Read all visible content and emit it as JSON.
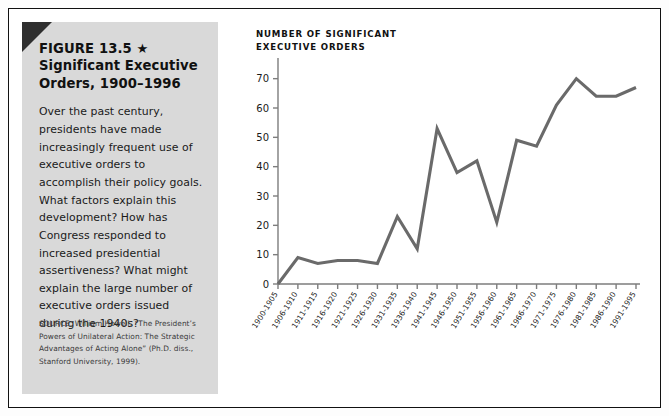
{
  "figure": {
    "title_line1": "FIGURE 13.5 ★",
    "title_line2": "Significant Executive",
    "title_line3": "Orders, 1900–1996",
    "body": "Over the past century, presidents have made increasingly frequent use of executive orders to accomplish their policy goals. What factors explain this development? How has Congress responded to increased presidential assertiveness? What might explain the large number of executive orders issued during the 1940s?",
    "source": "SOURCE: William Howell, “The President’s Powers of Unilateral Action: The Strategic Advantages of Acting Alone” (Ph.D. diss., Stanford University, 1999).",
    "panel_color": "#d9d9d9",
    "corner_color": "#2f2f2f",
    "border_color": "#111111"
  },
  "chart_data": {
    "type": "line",
    "title": "NUMBER OF SIGNIFICANT\nEXECUTIVE ORDERS",
    "xlabel": "",
    "ylabel": "NUMBER OF SIGNIFICANT EXECUTIVE ORDERS",
    "categories": [
      "1900-1905",
      "1906-1910",
      "1911-1915",
      "1916-1920",
      "1921-1925",
      "1926-1930",
      "1931-1935",
      "1936-1940",
      "1941-1945",
      "1946-1950",
      "1951-1955",
      "1956-1960",
      "1961-1965",
      "1966-1970",
      "1971-1975",
      "1976-1980",
      "1981-1985",
      "1986-1990",
      "1991-1995"
    ],
    "values": [
      0,
      9,
      7,
      8,
      8,
      7,
      23,
      12,
      53,
      38,
      42,
      21,
      49,
      47,
      61,
      70,
      64,
      64,
      67
    ],
    "ytick_labels": [
      "0",
      "10",
      "20",
      "30",
      "40",
      "50",
      "60",
      "70"
    ],
    "ytick_values": [
      0,
      10,
      20,
      30,
      40,
      50,
      60,
      70
    ],
    "ylim": [
      0,
      75
    ],
    "grid": false,
    "legend": "none",
    "line_color": "#6a6a6a",
    "axis_color": "#7d7d7d"
  }
}
